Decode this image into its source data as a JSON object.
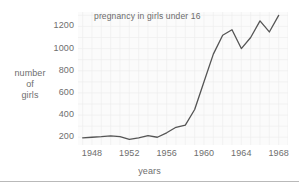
{
  "chart_data": {
    "type": "line",
    "title": "pregnancy in girls under 16",
    "xlabel": "years",
    "ylabel": "number of girls",
    "ylabel_lines": [
      "number",
      "of",
      "girls"
    ],
    "xtick_labels": [
      "1948",
      "1952",
      "1956",
      "1960",
      "1964",
      "1968"
    ],
    "xtick_values": [
      1948,
      1952,
      1956,
      1960,
      1964,
      1968
    ],
    "ytick_labels": [
      "200",
      "400",
      "600",
      "800",
      "1000",
      "1200"
    ],
    "ytick_values": [
      200,
      400,
      600,
      800,
      1000,
      1200
    ],
    "xlim": [
      1946.5,
      1969.0
    ],
    "ylim": [
      130,
      1330
    ],
    "grid": true,
    "legend": null,
    "line_color": "#555555",
    "plot_bg_color": "#fbfbfb",
    "text_color": "#6e6e6e",
    "x": [
      1947,
      1948,
      1949,
      1950,
      1951,
      1952,
      1953,
      1954,
      1955,
      1956,
      1957,
      1958,
      1959,
      1960,
      1961,
      1962,
      1963,
      1964,
      1965,
      1966,
      1967,
      1968
    ],
    "values": [
      195,
      200,
      205,
      212,
      205,
      180,
      195,
      215,
      200,
      240,
      290,
      310,
      450,
      700,
      950,
      1120,
      1170,
      1000,
      1100,
      1250,
      1150,
      1300
    ],
    "series": [
      {
        "name": "number of girls",
        "values": [
          195,
          200,
          205,
          212,
          205,
          180,
          195,
          215,
          200,
          240,
          290,
          310,
          450,
          700,
          950,
          1120,
          1170,
          1000,
          1100,
          1250,
          1150,
          1300
        ]
      }
    ]
  }
}
